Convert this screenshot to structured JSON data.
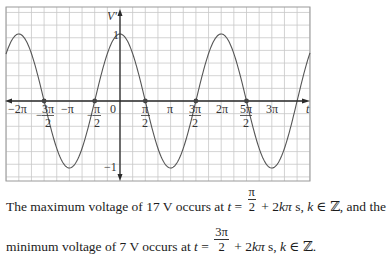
{
  "chart_data": {
    "type": "line",
    "function": "V'(t) = cos(t)",
    "title": "",
    "xlabel": "t",
    "ylabel": "V'",
    "xlim": [
      -7.54,
      9.95
    ],
    "ylim": [
      -1.25,
      1.25
    ],
    "grid": true,
    "x_tick_labels": [
      "-2π",
      "-3π/2",
      "-π",
      "-π/2",
      "0",
      "π/2",
      "π",
      "3π/2",
      "2π",
      "5π/2",
      "3π"
    ],
    "y_tick_labels": [
      "1",
      "-1"
    ],
    "highlighted_points": [
      {
        "label": "-3π/2",
        "x": -4.712,
        "y": 0
      },
      {
        "label": "-π/2",
        "x": -1.571,
        "y": 0
      },
      {
        "label": "π/2",
        "x": 1.571,
        "y": 0
      },
      {
        "label": "3π/2",
        "x": 4.712,
        "y": 0
      },
      {
        "label": "5π/2",
        "x": 7.854,
        "y": 0
      }
    ],
    "series": [
      {
        "name": "V'(t)",
        "x": [
          -7.4,
          -6.283,
          -4.712,
          -3.142,
          -1.571,
          0,
          1.571,
          3.142,
          4.712,
          6.283,
          7.854,
          9.425,
          9.9
        ],
        "values": [
          0.44,
          1,
          0,
          -1,
          0,
          1,
          0,
          -1,
          0,
          1,
          0,
          -1,
          -0.89
        ]
      }
    ]
  },
  "axes": {
    "y_label": "V'",
    "x_label": "t",
    "y_max_label": "1",
    "y_min_label": "−1",
    "origin_label": "0",
    "ticks": {
      "neg_2pi": "−2π",
      "neg_pi": "−π",
      "pi": "π",
      "two_pi": "2π",
      "three_pi": "3π",
      "neg_3pi_2_num": "3π",
      "neg_pi_2_num": "π",
      "pi_2_num": "π",
      "three_pi_2_num": "3π",
      "five_pi_2_num": "5π",
      "den": "2",
      "minus": "−"
    }
  },
  "caption": {
    "line1_a": "The maximum voltage of 17 V occurs at ",
    "line1_t": "t",
    "line1_eq": " = ",
    "line1_num": "π",
    "line1_den": "2",
    "line1_b": " + 2",
    "line1_k": "kπ",
    "line1_c": " s, ",
    "line1_k2": "k",
    "line1_d": " ∈ ℤ, and the",
    "line2_a": "minimum voltage of 7 V occurs at ",
    "line2_t": "t",
    "line2_eq": " = ",
    "line2_num": "3π",
    "line2_den": "2",
    "line2_b": " + 2",
    "line2_k": "kπ",
    "line2_c": " s, ",
    "line2_k2": "k",
    "line2_d": " ∈ ℤ."
  },
  "colors": {
    "grid": "#c8c8c8",
    "axis": "#2a2a2a",
    "curve": "#555555",
    "frame": "#9a9a9a",
    "point": "#444444"
  }
}
